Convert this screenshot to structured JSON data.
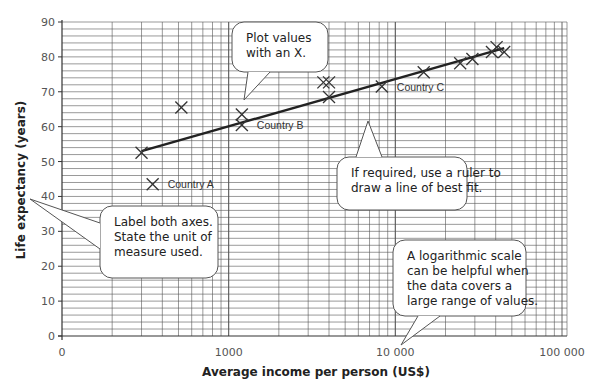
{
  "chart_data": {
    "type": "scatter",
    "title": "",
    "xlabel": "Average income per person (US$)",
    "ylabel": "Life expectancy (years)",
    "xscale": "log",
    "xlim": [
      100,
      100000
    ],
    "ylim": [
      0,
      90
    ],
    "x_tick_labels": [
      "0",
      "1000",
      "10 000",
      "100 000"
    ],
    "y_ticks": [
      0,
      10,
      20,
      30,
      40,
      50,
      60,
      70,
      80,
      90
    ],
    "grid": true,
    "grid_minor_y_step": 2,
    "legend": null,
    "series": [
      {
        "name": "Countries",
        "marker": "x",
        "points": [
          {
            "x": 300,
            "y": 52.5
          },
          {
            "x": 350,
            "y": 43.5,
            "label": "Country A"
          },
          {
            "x": 520,
            "y": 65.5
          },
          {
            "x": 1200,
            "y": 63.5
          },
          {
            "x": 1200,
            "y": 60.5,
            "label": "Country B"
          },
          {
            "x": 3700,
            "y": 72.7
          },
          {
            "x": 4000,
            "y": 72.7
          },
          {
            "x": 4000,
            "y": 68.5
          },
          {
            "x": 8300,
            "y": 71.5,
            "label": "Country C"
          },
          {
            "x": 14800,
            "y": 75.6
          },
          {
            "x": 24500,
            "y": 78.2
          },
          {
            "x": 29000,
            "y": 79.4
          },
          {
            "x": 38000,
            "y": 81.4
          },
          {
            "x": 40500,
            "y": 82.8
          },
          {
            "x": 45000,
            "y": 81.4
          }
        ]
      }
    ],
    "best_fit_line": {
      "x": [
        300,
        45000
      ],
      "y": [
        53,
        82.5
      ]
    },
    "annotations": [
      {
        "id": "plot",
        "text": [
          "Plot values",
          "with an X."
        ]
      },
      {
        "id": "fit",
        "text": [
          "If required, use a ruler to",
          "draw a line of best fit."
        ]
      },
      {
        "id": "axes",
        "text": [
          "Label both axes.",
          "State the unit of",
          "measure used."
        ]
      },
      {
        "id": "log",
        "text": [
          "A logarithmic scale",
          "can be helpful when",
          "the data covers a",
          "large range of values."
        ]
      }
    ]
  },
  "colors": {
    "grid": "#555555",
    "line": "#222222",
    "marker": "#333333",
    "callout_fill": "#ffffff",
    "callout_stroke": "#555555"
  }
}
